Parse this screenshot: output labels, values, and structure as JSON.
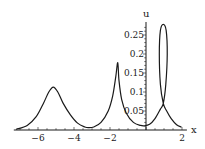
{
  "chart_data": {
    "type": "line",
    "title": "",
    "xlabel": "x",
    "ylabel": "u",
    "xlim": [
      -7.4,
      2.3
    ],
    "ylim": [
      0,
      0.3
    ],
    "grid": false,
    "legend": null,
    "x_ticks": [
      -6,
      -4,
      -2,
      2
    ],
    "x_tick_labels": [
      "−6",
      "−4",
      "−2",
      "2"
    ],
    "y_ticks": [
      0.05,
      0.1,
      0.15,
      0.2,
      0.25
    ],
    "y_tick_labels": [
      "0.05",
      "0.1",
      "0.15",
      "0.2",
      "0.25"
    ],
    "series": [
      {
        "name": "u(x)",
        "description": "Parametric curve: smooth peak near x=-5.15, cusp-like peak near x=-1.57, then a narrow self-intersecting loop near x=0.96",
        "points": [
          [
            -7.2,
            0.002
          ],
          [
            -6.6,
            0.012
          ],
          [
            -6.1,
            0.035
          ],
          [
            -5.7,
            0.07
          ],
          [
            -5.4,
            0.1
          ],
          [
            -5.15,
            0.113
          ],
          [
            -4.9,
            0.1
          ],
          [
            -4.6,
            0.07
          ],
          [
            -4.2,
            0.04
          ],
          [
            -3.8,
            0.018
          ],
          [
            -3.4,
            0.008
          ],
          [
            -3.2,
            0.006
          ],
          [
            -2.9,
            0.008
          ],
          [
            -2.5,
            0.02
          ],
          [
            -2.1,
            0.05
          ],
          [
            -1.85,
            0.09
          ],
          [
            -1.68,
            0.14
          ],
          [
            -1.57,
            0.177
          ],
          [
            -1.5,
            0.13
          ],
          [
            -1.35,
            0.08
          ],
          [
            -1.1,
            0.045
          ],
          [
            -0.7,
            0.02
          ],
          [
            -0.3,
            0.012
          ],
          [
            -0.1,
            0.011
          ],
          [
            0.2,
            0.015
          ],
          [
            0.5,
            0.03
          ],
          [
            0.8,
            0.055
          ],
          [
            0.96,
            0.07
          ],
          [
            1.1,
            0.12
          ],
          [
            1.18,
            0.2
          ],
          [
            1.12,
            0.262
          ],
          [
            0.96,
            0.278
          ],
          [
            0.8,
            0.262
          ],
          [
            0.74,
            0.2
          ],
          [
            0.8,
            0.12
          ],
          [
            0.96,
            0.07
          ],
          [
            1.15,
            0.05
          ],
          [
            1.4,
            0.03
          ],
          [
            1.7,
            0.014
          ],
          [
            1.95,
            0.008
          ]
        ],
        "peaks": [
          {
            "x": -5.15,
            "u": 0.113
          },
          {
            "x": -1.57,
            "u": 0.177
          },
          {
            "x": 0.96,
            "u": 0.278
          }
        ],
        "minima": [
          {
            "x": -3.2,
            "u": 0.006
          },
          {
            "x": -0.1,
            "u": 0.011
          }
        ],
        "self_intersection": {
          "x": 0.96,
          "u": 0.07
        }
      }
    ]
  }
}
